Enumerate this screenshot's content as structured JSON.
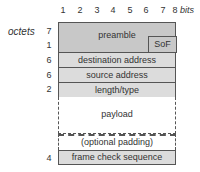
{
  "bits": {
    "labels": [
      "1",
      "2",
      "3",
      "4",
      "5",
      "6",
      "7",
      "8"
    ],
    "unit": "bits"
  },
  "octets_label": "octets",
  "fields": [
    {
      "name": "preamble",
      "octets": "7",
      "label": "preamble"
    },
    {
      "name": "sof",
      "octets": "1",
      "label": "SoF"
    },
    {
      "name": "destination",
      "octets": "6",
      "label": "destination address"
    },
    {
      "name": "source",
      "octets": "6",
      "label": "source address"
    },
    {
      "name": "length",
      "octets": "2",
      "label": "length/type"
    },
    {
      "name": "payload",
      "octets": "",
      "label": "payload"
    },
    {
      "name": "padding",
      "octets": "",
      "label": "(optional padding)"
    },
    {
      "name": "fcs",
      "octets": "4",
      "label": "frame check sequence"
    }
  ]
}
